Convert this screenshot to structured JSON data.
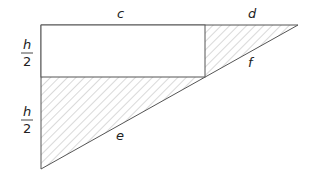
{
  "diagram": {
    "type": "geometry-figure",
    "labels": {
      "top_rect": "c",
      "top_right": "d",
      "hypotenuse_upper": "f",
      "hypotenuse_lower": "e",
      "left_upper_num": "h",
      "left_upper_den": "2",
      "left_lower_num": "h",
      "left_lower_den": "2"
    },
    "colors": {
      "stroke": "#555555",
      "hatch": "#9a9a9a",
      "fill": "#ffffff"
    }
  }
}
